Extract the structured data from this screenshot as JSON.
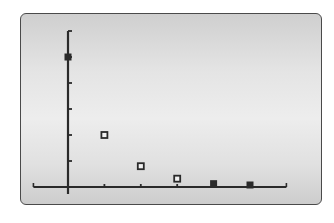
{
  "chart_data": {
    "type": "scatter",
    "title": "",
    "xlabel": "",
    "ylabel": "",
    "x": [
      0,
      1,
      2,
      3,
      4,
      5
    ],
    "values": [
      5,
      2,
      0.8,
      0.32,
      0.128,
      0.0512
    ],
    "series": [
      {
        "name": "sequence",
        "x": [
          0,
          1,
          2,
          3,
          4,
          5
        ],
        "values": [
          5,
          2,
          0.8,
          0.32,
          0.128,
          0.0512
        ]
      }
    ],
    "xlim": [
      -0.95,
      6
    ],
    "ylim": [
      0,
      6
    ],
    "xticks": [
      1,
      2,
      3,
      4,
      5
    ],
    "yticks": [
      1,
      2,
      3,
      4,
      5,
      6
    ],
    "tick_labels_visible": false,
    "grid": false,
    "legend": null,
    "marker": "square",
    "style": "graphing-calculator screen"
  },
  "colors": {
    "axis": "#2a2a2a",
    "marker": "#2a2a2a",
    "screen_border": "#4a4a4a"
  },
  "layout": {
    "origin_px": [
      68,
      187
    ],
    "x_unit_px": 36.4,
    "y_unit_px": 26
  }
}
